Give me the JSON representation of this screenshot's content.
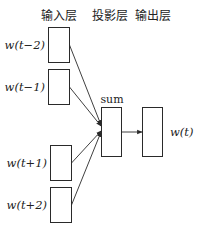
{
  "diagram": {
    "layers": {
      "input": "输入层",
      "projection": "投影层",
      "output": "输出层"
    },
    "projection_label": "sum",
    "inputs": [
      {
        "label": "w(t−2)"
      },
      {
        "label": "w(t−1)"
      },
      {
        "label": "w(t+1)"
      },
      {
        "label": "w(t+2)"
      }
    ],
    "output": {
      "label": "w(t)"
    },
    "colors": {
      "stroke": "#2a2a2a",
      "background": "#ffffff"
    }
  }
}
